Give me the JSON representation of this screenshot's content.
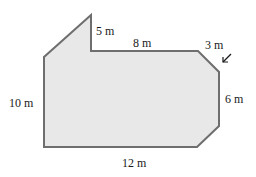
{
  "diagram": {
    "type": "composite-polygon-floor-plan",
    "colors": {
      "fill": "#e8e8e8",
      "stroke": "#6e6e6e",
      "text": "#1a1a1a"
    },
    "labels": {
      "top_spike": "5 m",
      "top_edge": "8 m",
      "corner_cut": "3 m",
      "right_edge": "6 m",
      "left_edge": "10 m",
      "bottom_edge": "12 m"
    },
    "pointer_icon": "arrow-down-left"
  }
}
